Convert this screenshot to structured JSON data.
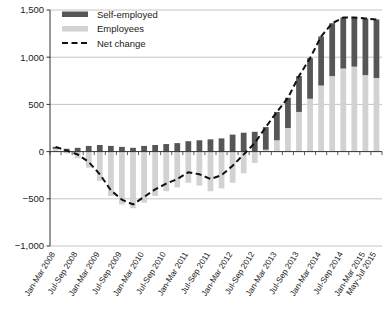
{
  "chart_data": {
    "type": "bar",
    "title": "",
    "subtitle": "",
    "xlabel": "",
    "ylabel": "",
    "ylim": [
      -1000,
      1500
    ],
    "ytick_values": [
      -1000,
      -500,
      0,
      500,
      1000,
      1500
    ],
    "ytick_labels": [
      "−1,000",
      "−500",
      "0",
      "500",
      "1,000",
      "1,500"
    ],
    "grid": true,
    "grid_axis": "y",
    "legend_position": "top-left",
    "stacked": true,
    "legend": [
      "Self-employed",
      "Employees",
      "Net change"
    ],
    "colors": {
      "self_employed": "#565656",
      "employees": "#d2d2d2",
      "net_change": "#111111",
      "gridline": "#b5b5b5",
      "axis": "#333333"
    },
    "categories": [
      "Jan-Mar 2008",
      "Apr-Jun 2008",
      "Jul-Sep 2008",
      "Oct-Dec 2008",
      "Jan-Mar 2009",
      "Apr-Jun 2009",
      "Jul-Sep 2009",
      "Oct-Dec 2009",
      "Jan-Mar 2010",
      "Apr-Jun 2010",
      "Jul-Sep 2010",
      "Oct-Dec 2010",
      "Jan-Mar 2011",
      "Apr-Jun 2011",
      "Jul-Sep 2011",
      "Oct-Dec 2011",
      "Jan-Mar 2012",
      "Apr-Jun 2012",
      "Jul-Sep 2012",
      "Oct-Dec 2012",
      "Jan-Mar 2013",
      "Apr-Jun 2013",
      "Jul-Sep 2013",
      "Oct-Dec 2013",
      "Jan-Mar 2014",
      "Apr-Jun 2014",
      "Jul-Sep 2014",
      "Oct-Dec 2014",
      "Jan-Mar 2015",
      "May-Jul 2015"
    ],
    "xtick_labels_shown": [
      "Jan-Mar 2008",
      "Jul-Sep 2008",
      "Jan-Mar 2009",
      "Jul-Sep 2009",
      "Jan-Mar 2010",
      "Jul-Sep 2010",
      "Jan-Mar 2011",
      "Jul-Sep 2011",
      "Jan-Mar 2012",
      "Jul-Sep 2012",
      "Jan-Mar 2013",
      "Jul-Sep 2013",
      "Jan-Mar 2014",
      "Jul-Sep 2014",
      "Jan-Mar 2015",
      "May-Jul 2015"
    ],
    "series": [
      {
        "name": "Employees",
        "key": "employees",
        "values": [
          30,
          -20,
          -70,
          -170,
          -310,
          -470,
          -560,
          -600,
          -540,
          -470,
          -420,
          -380,
          -330,
          -360,
          -420,
          -390,
          -330,
          -230,
          -120,
          20,
          120,
          250,
          420,
          560,
          700,
          800,
          880,
          900,
          810,
          780
        ]
      },
      {
        "name": "Self-employed",
        "key": "self_employed",
        "values": [
          20,
          30,
          40,
          60,
          70,
          60,
          50,
          40,
          60,
          70,
          80,
          90,
          110,
          120,
          130,
          140,
          180,
          200,
          210,
          240,
          300,
          320,
          380,
          430,
          520,
          560,
          540,
          520,
          600,
          620
        ]
      }
    ],
    "net_change": {
      "name": "Net change",
      "style": "dashed",
      "values": [
        50,
        10,
        -30,
        -110,
        -240,
        -410,
        -510,
        -560,
        -480,
        -400,
        -340,
        -290,
        -220,
        -240,
        -290,
        -250,
        -150,
        -30,
        90,
        260,
        420,
        570,
        800,
        990,
        1220,
        1360,
        1420,
        1420,
        1410,
        1400
      ]
    }
  }
}
